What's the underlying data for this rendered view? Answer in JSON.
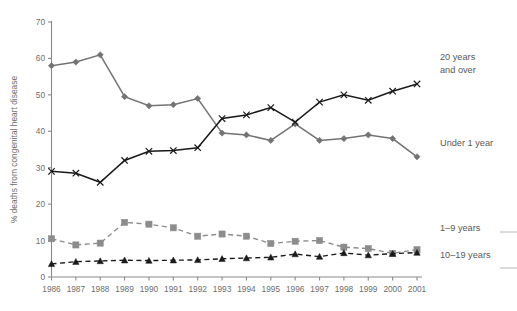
{
  "chart_data": {
    "type": "line",
    "title": "",
    "subtitle": "",
    "xlabel": "",
    "ylabel": "% deaths from congenital heart disease",
    "x": [
      1986,
      1987,
      1988,
      1989,
      1990,
      1991,
      1992,
      1993,
      1994,
      1995,
      1996,
      1997,
      1998,
      1999,
      2000,
      2001
    ],
    "xtick_labels": [
      "1986",
      "1987",
      "1988",
      "1989",
      "1990",
      "1991",
      "1992",
      "1993",
      "1994",
      "1995",
      "1996",
      "1997",
      "1998",
      "1999",
      "2000",
      "2001"
    ],
    "ytick_labels": [
      "0",
      "10",
      "20",
      "30",
      "40",
      "50",
      "60",
      "70"
    ],
    "ytick_values": [
      0,
      10,
      20,
      30,
      40,
      50,
      60,
      70
    ],
    "ylim": [
      0,
      70
    ],
    "grid": false,
    "legend_position": "right-inline-annotations",
    "series": [
      {
        "name": "Under 1 year",
        "label": "Under 1 year",
        "color": "#737373",
        "marker": "diamond",
        "linestyle": "solid",
        "values": [
          58,
          59,
          61,
          49.5,
          47,
          47.3,
          49,
          39.5,
          39,
          37.5,
          42,
          37.5,
          38,
          39,
          38,
          33
        ]
      },
      {
        "name": "20 years and over",
        "label": "20 years and over",
        "color": "#1a1a1a",
        "marker": "x",
        "linestyle": "solid",
        "values": [
          29,
          28.5,
          26,
          32,
          34.5,
          34.7,
          35.5,
          43.5,
          44.5,
          46.5,
          42.5,
          48,
          50,
          48.5,
          51,
          53
        ]
      },
      {
        "name": "1–9 years",
        "label": "1–9 years",
        "color": "#8c8c8c",
        "marker": "square",
        "linestyle": "dashed",
        "values": [
          10.5,
          8.8,
          9.3,
          15,
          14.5,
          13.5,
          11.2,
          11.8,
          11.2,
          9.2,
          9.8,
          10,
          8.2,
          7.8,
          6.5,
          7.5
        ]
      },
      {
        "name": "10–19 years",
        "label": "10–19 years",
        "color": "#1a1a1a",
        "marker": "triangle",
        "linestyle": "dashed",
        "values": [
          3.6,
          4.2,
          4.4,
          4.6,
          4.5,
          4.6,
          4.7,
          5,
          5.2,
          5.4,
          6.3,
          5.6,
          6.6,
          6,
          6.4,
          6.7
        ]
      }
    ],
    "annotations": [
      {
        "text": "20 years",
        "for": "20 years and over"
      },
      {
        "text": "and over",
        "for": "20 years and over"
      },
      {
        "text": "Under 1 year",
        "for": "Under 1 year"
      },
      {
        "text": "1–9 years",
        "for": "1–9 years"
      },
      {
        "text": "10–19 years",
        "for": "10–19 years"
      }
    ]
  }
}
